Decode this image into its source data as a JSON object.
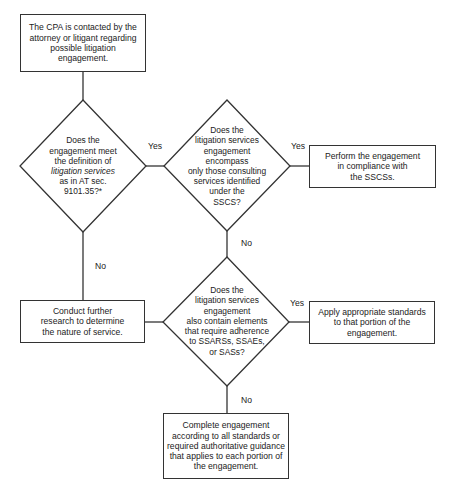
{
  "flowchart": {
    "start_box": {
      "lines": [
        "The CPA is contacted by the",
        "attorney or litigant regarding",
        "possible litigation",
        "engagement."
      ]
    },
    "decision_1": {
      "lines": [
        "Does the",
        "engagement meet",
        "the definition of",
        "litigation services",
        "as in AT sec.",
        "9101.35?*"
      ],
      "italic_line_index": 3
    },
    "decision_2": {
      "lines": [
        "Does the",
        "litigation services",
        "engagement",
        "encompass",
        "only those consulting",
        "services identified",
        "under the",
        "SSCS?"
      ]
    },
    "result_sscs_box": {
      "lines": [
        "Perform the engagement",
        "in compliance with",
        "the SSCSs."
      ]
    },
    "decision_3": {
      "lines": [
        "Does the",
        "litigation services",
        "engagement",
        "also contain elements",
        "that require adherence",
        "to SSARSs, SSAEs,",
        "or SASs?"
      ]
    },
    "research_box": {
      "lines": [
        "Conduct further",
        "research to determine",
        "the nature of service."
      ]
    },
    "apply_standards_box": {
      "lines": [
        "Apply appropriate standards",
        "to that portion of the",
        "engagement."
      ]
    },
    "complete_box": {
      "lines": [
        "Complete engagement",
        "according to all standards or",
        "required authoritative guidance",
        "that applies to each portion of",
        "the engagement."
      ]
    },
    "edge_labels": {
      "d1_yes": "Yes",
      "d1_no": "No",
      "d2_yes": "Yes",
      "d2_no": "No",
      "d3_yes": "Yes",
      "d3_no": "No"
    },
    "colors": {
      "stroke": "#333333",
      "text": "#222222",
      "background": "#ffffff"
    }
  }
}
